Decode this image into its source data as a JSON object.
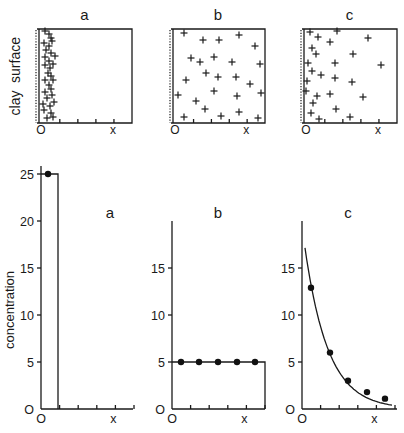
{
  "top_row": {
    "side_labels": [
      "surface",
      "clay"
    ],
    "panels": [
      {
        "label": "a",
        "x_labels": [
          "O",
          "x"
        ],
        "description": "particles concentrated next to clay surface",
        "box": {
          "left": 37,
          "right": 132,
          "top": 29,
          "bottom": 123
        },
        "particles": [
          [
            45,
            31
          ],
          [
            49,
            34
          ],
          [
            51,
            38
          ],
          [
            44,
            43
          ],
          [
            49,
            46
          ],
          [
            52,
            41
          ],
          [
            46,
            50
          ],
          [
            51,
            53
          ],
          [
            45,
            57
          ],
          [
            49,
            61
          ],
          [
            55,
            56
          ],
          [
            45,
            65
          ],
          [
            50,
            68
          ],
          [
            53,
            64
          ],
          [
            48,
            73
          ],
          [
            51,
            76
          ],
          [
            45,
            80
          ],
          [
            53,
            80
          ],
          [
            49,
            85
          ],
          [
            51,
            89
          ],
          [
            45,
            92
          ],
          [
            52,
            95
          ],
          [
            47,
            98
          ],
          [
            43,
            104
          ],
          [
            50,
            106
          ],
          [
            54,
            102
          ],
          [
            44,
            110
          ],
          [
            51,
            113
          ],
          [
            53,
            117
          ],
          [
            47,
            118
          ]
        ]
      },
      {
        "label": "b",
        "x_labels": [
          "O",
          "x"
        ],
        "description": "particles uniformly distributed",
        "box": {
          "left": 171,
          "right": 265,
          "top": 29,
          "bottom": 123
        },
        "particles": [
          [
            184,
            33
          ],
          [
            203,
            40
          ],
          [
            219,
            40
          ],
          [
            239,
            35
          ],
          [
            255,
            46
          ],
          [
            191,
            58
          ],
          [
            200,
            62
          ],
          [
            214,
            57
          ],
          [
            232,
            62
          ],
          [
            260,
            64
          ],
          [
            206,
            73
          ],
          [
            218,
            77
          ],
          [
            236,
            77
          ],
          [
            250,
            84
          ],
          [
            186,
            80
          ],
          [
            178,
            95
          ],
          [
            214,
            91
          ],
          [
            237,
            96
          ],
          [
            261,
            93
          ],
          [
            196,
            101
          ],
          [
            205,
            109
          ],
          [
            239,
            112
          ],
          [
            184,
            117
          ],
          [
            221,
            116
          ],
          [
            258,
            118
          ]
        ]
      },
      {
        "label": "c",
        "x_labels": [
          "O",
          "x"
        ],
        "description": "particle density decreasing with distance from surface",
        "box": {
          "left": 302,
          "right": 397,
          "top": 29,
          "bottom": 123
        },
        "particles": [
          [
            310,
            32
          ],
          [
            337,
            31
          ],
          [
            318,
            37
          ],
          [
            330,
            42
          ],
          [
            368,
            38
          ],
          [
            312,
            48
          ],
          [
            316,
            54
          ],
          [
            353,
            54
          ],
          [
            308,
            63
          ],
          [
            335,
            63
          ],
          [
            381,
            65
          ],
          [
            312,
            71
          ],
          [
            321,
            75
          ],
          [
            335,
            78
          ],
          [
            352,
            82
          ],
          [
            307,
            81
          ],
          [
            306,
            91
          ],
          [
            317,
            96
          ],
          [
            330,
            94
          ],
          [
            363,
            97
          ],
          [
            313,
            103
          ],
          [
            336,
            109
          ],
          [
            311,
            113
          ],
          [
            319,
            119
          ],
          [
            350,
            117
          ]
        ]
      }
    ]
  },
  "chart_data": [
    {
      "type": "bar",
      "panel": "a",
      "title": "a",
      "xlabel": "",
      "ylabel": "concentration",
      "x_tick_labels": [
        "O",
        "x"
      ],
      "y_ticks": [
        0,
        5,
        10,
        15,
        20,
        25
      ],
      "ylim": [
        0,
        25
      ],
      "points": [
        {
          "x": 0.5,
          "y": 25
        }
      ],
      "step": {
        "x_end": 1,
        "y": 25
      },
      "grid": false
    },
    {
      "type": "line",
      "panel": "b",
      "title": "b",
      "xlabel": "",
      "ylabel": "",
      "x_tick_labels": [
        "O",
        "x"
      ],
      "y_ticks": [
        0,
        5,
        10,
        15
      ],
      "ylim": [
        0,
        20
      ],
      "points": [
        {
          "x": 1,
          "y": 5
        },
        {
          "x": 2,
          "y": 5
        },
        {
          "x": 3,
          "y": 5
        },
        {
          "x": 4,
          "y": 5
        },
        {
          "x": 5,
          "y": 5
        }
      ],
      "step": {
        "x_end": 5,
        "y": 5
      },
      "grid": false
    },
    {
      "type": "line",
      "panel": "c",
      "title": "c",
      "xlabel": "",
      "ylabel": "",
      "x_tick_labels": [
        "O",
        "x"
      ],
      "y_ticks": [
        0,
        5,
        10,
        15
      ],
      "ylim": [
        0,
        20
      ],
      "points": [
        {
          "x": 0.5,
          "y": 12.9
        },
        {
          "x": 1.5,
          "y": 6.0
        },
        {
          "x": 2.5,
          "y": 3.0
        },
        {
          "x": 3.5,
          "y": 1.8
        },
        {
          "x": 4.5,
          "y": 1.1
        }
      ],
      "curve": "exponential decay fit, from ~17.8 near x=0 to ~0.5 at right edge",
      "grid": false
    }
  ],
  "bottom_row": {
    "ylabel": "concentration",
    "y_tick_labels_a": [
      "O",
      "5",
      "10",
      "15",
      "20",
      "25"
    ],
    "y_tick_labels_bc": [
      "O",
      "5",
      "10",
      "15"
    ],
    "x_labels": [
      "O",
      "x"
    ],
    "panel_labels": [
      "a",
      "b",
      "c"
    ]
  }
}
